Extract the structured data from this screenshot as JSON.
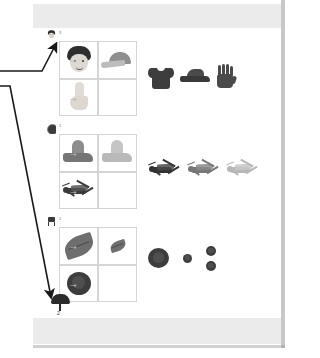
{
  "page": {
    "type": "scanned-worksheet",
    "background": "#ffffff",
    "band_color": "#ebebeb",
    "sheet_edge_shadow": "#9a9a9a"
  },
  "annotations": {
    "arrow_color": "#1a1a1a",
    "arrows": [
      {
        "name": "arrow-to-row-1-marker",
        "target": "row-1-marker",
        "label": ""
      },
      {
        "name": "arrow-to-umbrella-marker",
        "target": "umbrella-marker",
        "label": ""
      }
    ]
  },
  "rows": [
    {
      "id": "row-1",
      "marker": {
        "icon": "thumbnail-icon",
        "count": "3"
      },
      "prompt_cells": [
        {
          "position": "top-left",
          "icon": "boy-head-icon",
          "filled": true
        },
        {
          "position": "top-right",
          "icon": "cap-icon",
          "filled": true
        },
        {
          "position": "bottom-left",
          "icon": "foot-icon",
          "filled": true
        },
        {
          "position": "bottom-right",
          "icon": "empty-answer-slot",
          "filled": false
        }
      ],
      "relation_arrow": "arrow-right-icon",
      "options": [
        {
          "icon": "tshirt-icon"
        },
        {
          "icon": "shoe-icon"
        },
        {
          "icon": "glove-icon"
        }
      ]
    },
    {
      "id": "row-2",
      "marker": {
        "icon": "circle-icon",
        "count": "1"
      },
      "prompt_cells": [
        {
          "position": "top-left",
          "icon": "dark-shape-icon",
          "filled": true
        },
        {
          "position": "top-right",
          "icon": "light-shape-icon",
          "filled": true
        },
        {
          "position": "bottom-left",
          "icon": "grasshopper-dark-icon",
          "filled": true
        },
        {
          "position": "bottom-right",
          "icon": "empty-answer-slot",
          "filled": false
        }
      ],
      "relation_arrow": "arrow-right-icon",
      "options": [
        {
          "icon": "grasshopper-dark-icon"
        },
        {
          "icon": "grasshopper-medium-icon"
        },
        {
          "icon": "grasshopper-light-icon"
        }
      ]
    },
    {
      "id": "row-3",
      "marker": {
        "icon": "chair-icon",
        "count": "1"
      },
      "prompt_cells": [
        {
          "position": "top-left",
          "icon": "leaf-large-icon",
          "filled": true
        },
        {
          "position": "top-right",
          "icon": "leaf-small-icon",
          "filled": true
        },
        {
          "position": "bottom-left",
          "icon": "flower-large-icon",
          "filled": true
        },
        {
          "position": "bottom-right",
          "icon": "empty-answer-slot",
          "filled": false
        }
      ],
      "relation_arrow": "arrow-right-icon",
      "options": [
        {
          "icon": "flower-large-icon"
        },
        {
          "icon": "flower-small-icon"
        },
        {
          "icon": "flower-pair-icon"
        }
      ]
    }
  ],
  "footer_marker": {
    "icon": "umbrella-icon",
    "count": "2"
  }
}
